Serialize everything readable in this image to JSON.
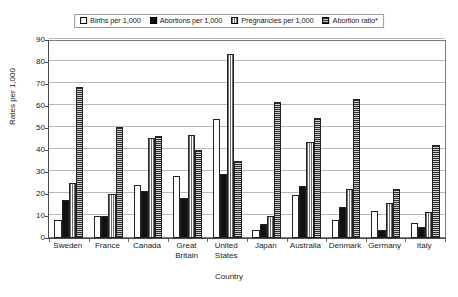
{
  "chart_data": {
    "type": "bar",
    "title": "",
    "xlabel": "Country",
    "ylabel": "Rates per 1,000",
    "ylim": [
      0,
      90
    ],
    "yticks": [
      0,
      10,
      20,
      30,
      40,
      50,
      60,
      70,
      80,
      90
    ],
    "grid": true,
    "legend_position": "top-center",
    "categories": [
      "Sweden",
      "France",
      "Canada",
      "Great Britain",
      "United States",
      "Japan",
      "Australia",
      "Denmark",
      "Germany",
      "Italy"
    ],
    "series": [
      {
        "name": "Births per 1,000",
        "pattern": "white-outline",
        "values": [
          8,
          10,
          24.3,
          28.2,
          54.2,
          3.8,
          19.6,
          8.2,
          12.3,
          6.9
        ]
      },
      {
        "name": "Abortions per 1,000",
        "pattern": "solid-black",
        "values": [
          17.2,
          10.2,
          21.2,
          18.1,
          29.1,
          6.2,
          23.6,
          14.2,
          3.5,
          4.9
        ]
      },
      {
        "name": "Pregnancies per 1,000",
        "pattern": "vertical-stripes",
        "values": [
          24.9,
          20.2,
          45.6,
          46.6,
          83.8,
          10.1,
          43.5,
          22.4,
          15.8,
          11.7
        ]
      },
      {
        "name": "Abortion ratio*",
        "pattern": "horizontal-stripes",
        "values": [
          68.8,
          50.6,
          46.4,
          39.9,
          34.8,
          61.7,
          54.4,
          63.3,
          22.2,
          42.2
        ]
      }
    ]
  },
  "legend": {
    "items": [
      {
        "label": "Births per 1,000",
        "swatch": "births-swatch"
      },
      {
        "label": "Abortions per 1,000",
        "swatch": "abortions-swatch"
      },
      {
        "label": "Pregnancies per 1,000",
        "swatch": "pregnancies-swatch"
      },
      {
        "label": "Abortion ratio*",
        "swatch": "abortion-ratio-swatch"
      }
    ]
  },
  "colors": {
    "frame": "#7d7d7d",
    "gridline": "#b9b9b9",
    "axis": "#4a4a4a",
    "bar_outline": "#222222",
    "series_births": "#ffffff",
    "series_abortions": "#111111",
    "series_pregnancies": "#6e6e6e",
    "series_ratio": "#5c5c5c",
    "background": "#ffffff"
  }
}
